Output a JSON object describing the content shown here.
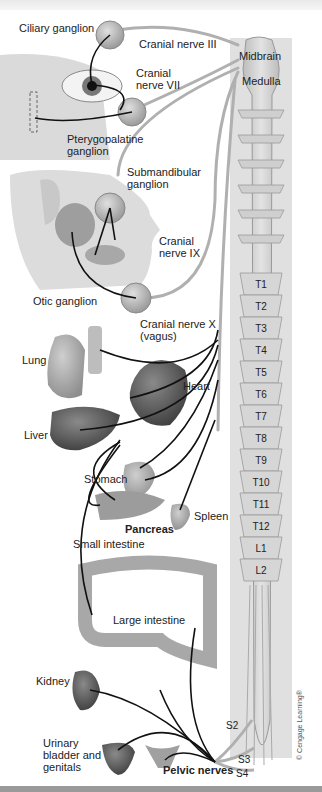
{
  "colors": {
    "background": "#ffffff",
    "nerve": "#111111",
    "nerve_trunk": "#b9b9b9",
    "ganglion": "#b8b8b8",
    "spinal_cord": "#d2d2d2",
    "organ_dark": "#5a5a5a",
    "organ_light": "#a8a8a8"
  },
  "labels": {
    "ciliary_ganglion": "Ciliary ganglion",
    "cranial_nerve_iii": "Cranial nerve III",
    "midbrain": "Midbrain",
    "medulla": "Medulla",
    "cranial_nerve_vii": "Cranial\nnerve VII",
    "pterygopalatine_ganglion": "Pterygopalatine\nganglion",
    "submandibular_ganglion": "Submandibular\nganglion",
    "cranial_nerve_ix": "Cranial\nnerve IX",
    "otic_ganglion": "Otic ganglion",
    "cranial_nerve_x": "Cranial nerve X\n(vagus)",
    "lung": "Lung",
    "heart": "Heart",
    "liver": "Liver",
    "stomach": "Stomach",
    "spleen": "Spleen",
    "pancreas": "Pancreas",
    "small_intestine": "Small intestine",
    "large_intestine": "Large intestine",
    "kidney": "Kidney",
    "urinary_bladder_genitals": "Urinary\nbladder and\ngenitals",
    "pelvic_nerves": "Pelvic nerves",
    "s2": "S2",
    "s3": "S3",
    "s4": "S4",
    "copyright": "© Cengage Learning®"
  },
  "spinal_segments": [
    "T1",
    "T2",
    "T3",
    "T4",
    "T5",
    "T6",
    "T7",
    "T8",
    "T9",
    "T10",
    "T11",
    "T12",
    "L1",
    "L2"
  ]
}
